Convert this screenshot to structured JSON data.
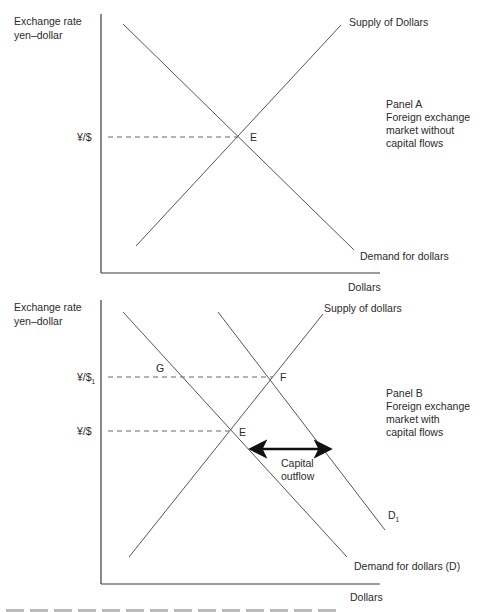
{
  "panel_a": {
    "y_axis_label_line1": "Exchange rate",
    "y_axis_label_line2": "yen–dollar",
    "x_axis_label": "Dollars",
    "supply_label": "Supply of Dollars",
    "demand_label": "Demand for dollars",
    "rate_tick": "¥/$",
    "equilibrium_label": "E",
    "title": "Panel A",
    "desc_line1": "Foreign exchange",
    "desc_line2": "market without",
    "desc_line3": "capital flows"
  },
  "panel_b": {
    "y_axis_label_line1": "Exchange rate",
    "y_axis_label_line2": "yen–dollar",
    "x_axis_label": "Dollars",
    "supply_label": "Supply of dollars",
    "demand_label": "Demand for dollars (D)",
    "demand_shifted_label": "D",
    "demand_shifted_sub": "1",
    "rate_tick_high": "¥/$",
    "rate_tick_high_sub": "1",
    "rate_tick": "¥/$",
    "point_g": "G",
    "point_f": "F",
    "point_e": "E",
    "arrow_label_line1": "Capital",
    "arrow_label_line2": "outflow",
    "title": "Panel B",
    "desc_line1": "Foreign exchange",
    "desc_line2": "market with",
    "desc_line3": "capital flows"
  }
}
